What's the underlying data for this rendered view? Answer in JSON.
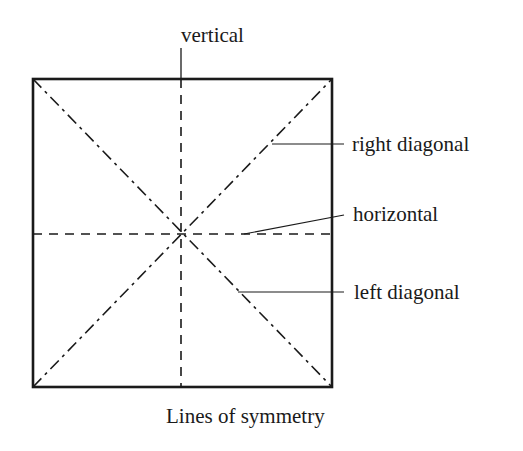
{
  "figure": {
    "caption": "Lines of symmetry",
    "shape": "square",
    "colors": {
      "stroke": "#1a1a1a",
      "background": "#ffffff"
    },
    "square": {
      "x1": 33,
      "y1": 79,
      "x2": 332,
      "y2": 387
    },
    "center": {
      "x": 182,
      "y": 233
    }
  },
  "labels": {
    "vertical": "vertical",
    "right_diagonal": "right diagonal",
    "horizontal": "horizontal",
    "left_diagonal": "left diagonal"
  },
  "symmetry_lines": [
    {
      "name": "vertical",
      "style": "dashed"
    },
    {
      "name": "horizontal",
      "style": "dashed"
    },
    {
      "name": "right diagonal",
      "style": "dash-dot"
    },
    {
      "name": "left diagonal",
      "style": "dash-dot"
    }
  ]
}
